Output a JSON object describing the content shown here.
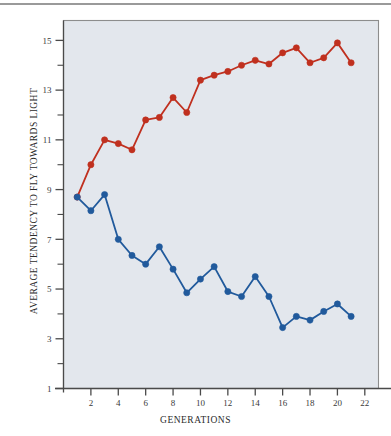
{
  "chart_data": {
    "type": "line",
    "title": "",
    "xlabel": "GENERATIONS",
    "ylabel": "AVERAGE TENDENCY TO FLY TOWARDS LIGHT",
    "xlim": [
      0,
      23
    ],
    "ylim": [
      1,
      15.8
    ],
    "grid": false,
    "legend_position": "none",
    "x_major_ticks": [
      2,
      4,
      6,
      8,
      10,
      12,
      14,
      16,
      18,
      20,
      22
    ],
    "x_tick_labels": [
      "2",
      "4",
      "6",
      "8",
      "10",
      "12",
      "14",
      "16",
      "18",
      "20",
      "22"
    ],
    "x_minor_ticks": [
      1,
      3,
      5,
      7,
      9,
      11,
      13,
      15,
      17,
      19,
      21,
      23
    ],
    "y_major_ticks": [
      1,
      3,
      5,
      7,
      9,
      11,
      13,
      15
    ],
    "y_tick_labels": [
      "1",
      "3",
      "5",
      "7",
      "9",
      "11",
      "13",
      "15"
    ],
    "y_minor_ticks": [
      2,
      4,
      6,
      8,
      10,
      12,
      14
    ],
    "plot_background": "#e3e7ed",
    "axis_color": "#4a4a4a",
    "series": [
      {
        "name": "positive-phototaxis-line",
        "color": "#c0301f",
        "marker": "circle",
        "x": [
          1,
          2,
          3,
          4,
          5,
          6,
          7,
          8,
          9,
          10,
          11,
          12,
          13,
          14,
          15,
          16,
          17,
          18,
          19,
          20
        ],
        "values": [
          8.7,
          10.0,
          11.0,
          10.85,
          10.6,
          11.8,
          11.9,
          12.7,
          12.1,
          13.4,
          13.6,
          13.75,
          14.0,
          14.2,
          14.05,
          14.5,
          14.7,
          14.1,
          14.3,
          14.9
        ]
      },
      {
        "name": "negative-phototaxis-line",
        "color": "#215a9c",
        "marker": "circle",
        "x": [
          1,
          2,
          3,
          4,
          5,
          6,
          7,
          8,
          9,
          10,
          11,
          12,
          13,
          14,
          15,
          16,
          17,
          18,
          19,
          20
        ],
        "values": [
          8.7,
          8.15,
          8.8,
          7.0,
          6.35,
          6.0,
          6.7,
          5.8,
          4.85,
          5.4,
          5.9,
          4.9,
          4.7,
          5.5,
          4.7,
          3.45,
          3.9,
          3.75,
          4.1,
          4.4
        ]
      }
    ],
    "series_tail_points": [
      {
        "series": "positive-phototaxis-line",
        "x": 21,
        "value": 14.1
      },
      {
        "series": "negative-phototaxis-line",
        "x": 21,
        "value": 3.9
      }
    ]
  }
}
